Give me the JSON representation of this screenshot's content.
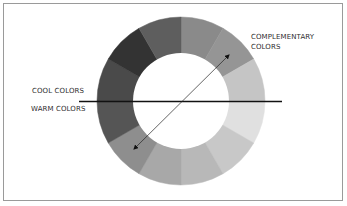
{
  "diagram": {
    "type": "color-wheel",
    "segments_count": 12,
    "segments": [
      {
        "index": 0,
        "color": "#8a8a8a"
      },
      {
        "index": 1,
        "color": "#959595"
      },
      {
        "index": 2,
        "color": "#c5c5c5"
      },
      {
        "index": 3,
        "color": "#e0e0e0"
      },
      {
        "index": 4,
        "color": "#c8c8c8"
      },
      {
        "index": 5,
        "color": "#b8b8b8"
      },
      {
        "index": 6,
        "color": "#a8a8a8"
      },
      {
        "index": 7,
        "color": "#8e8e8e"
      },
      {
        "index": 8,
        "color": "#555555"
      },
      {
        "index": 9,
        "color": "#4a4a4a"
      },
      {
        "index": 10,
        "color": "#333333"
      },
      {
        "index": 11,
        "color": "#5e5e5e"
      }
    ],
    "labels": {
      "complementary_line1": "COMPLEMENTARY",
      "complementary_line2": "COLORS",
      "cool": "COOL COLORS",
      "warm": "WARM COLORS"
    },
    "divider": "horizontal line separating cool colors (above) from warm colors (below)",
    "arrow": "double-headed arrow connecting complementary segments across the wheel"
  }
}
